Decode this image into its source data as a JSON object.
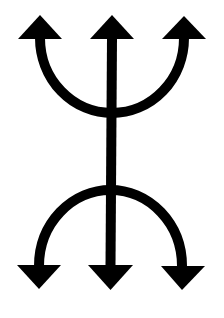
{
  "symbol": {
    "description": "Double trident symbol: three upward arrows joined by an arc, and three downward arrows joined by an arc, connected by a central vertical stem",
    "stroke_color": "#000000",
    "background_color": "#ffffff",
    "top_arrows": [
      "left-up-arrow",
      "center-up-arrow",
      "right-up-arrow"
    ],
    "bottom_arrows": [
      "left-down-arrow",
      "center-down-arrow",
      "right-down-arrow"
    ]
  }
}
